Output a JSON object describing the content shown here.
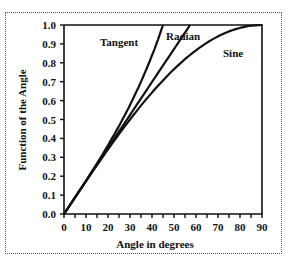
{
  "chart_data": {
    "type": "line",
    "title": "",
    "xlabel": "Angle in degrees",
    "ylabel": "Function of the Angle",
    "xlim": [
      0,
      90
    ],
    "ylim": [
      0,
      1.0
    ],
    "x_ticks": [
      "0",
      "10",
      "20",
      "30",
      "40",
      "50",
      "60",
      "70",
      "80",
      "90"
    ],
    "y_ticks": [
      "0.0",
      "0.1",
      "0.2",
      "0.3",
      "0.4",
      "0.5",
      "0.6",
      "0.7",
      "0.8",
      "0.9",
      "1.0"
    ],
    "grid": false,
    "legend": "inline labels",
    "series": [
      {
        "name": "Tangent",
        "x": [
          0,
          10,
          20,
          30,
          40,
          45
        ],
        "values": [
          0,
          0.176,
          0.364,
          0.577,
          0.839,
          1.0
        ]
      },
      {
        "name": "Radian",
        "x": [
          0,
          10,
          20,
          30,
          40,
          50,
          57.3
        ],
        "values": [
          0,
          0.175,
          0.349,
          0.524,
          0.698,
          0.873,
          1.0
        ]
      },
      {
        "name": "Sine",
        "x": [
          0,
          10,
          20,
          30,
          40,
          50,
          60,
          70,
          80,
          90
        ],
        "values": [
          0,
          0.174,
          0.342,
          0.5,
          0.643,
          0.766,
          0.866,
          0.94,
          0.985,
          1.0
        ]
      }
    ]
  },
  "labels": {
    "tangent": "Tangent",
    "radian": "Radian",
    "sine": "Sine",
    "xlabel": "Angle in degrees",
    "ylabel": "Function of the Angle"
  }
}
